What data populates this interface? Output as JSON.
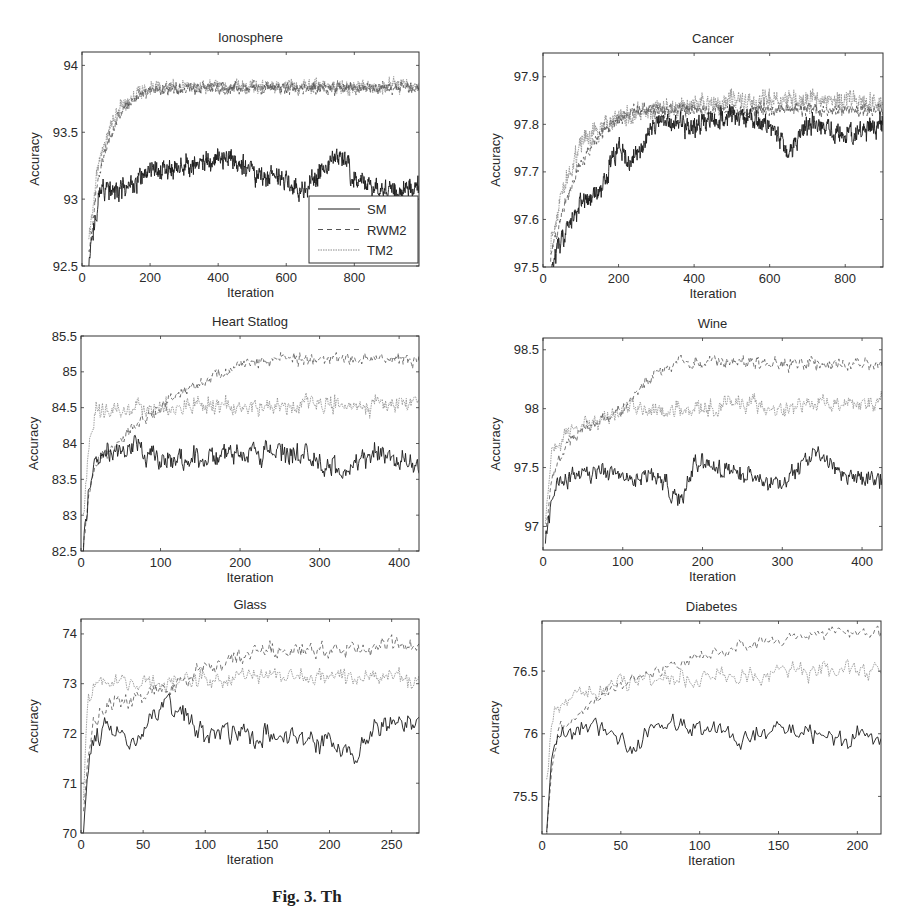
{
  "figure": {
    "caption_visible": "Fig. 3. Th",
    "legend": [
      {
        "name": "SM",
        "style": "solid",
        "color": "#1a1a1a"
      },
      {
        "name": "RWM2",
        "style": "dashed",
        "color": "#555555"
      },
      {
        "name": "TM2",
        "style": "dotted",
        "color": "#8a8a8a"
      }
    ]
  },
  "chart_data": [
    {
      "type": "line",
      "title": "Ionosphere",
      "xlabel": "Iteration",
      "ylabel": "Accuracy",
      "xlim": [
        0,
        990
      ],
      "ylim": [
        92.5,
        94.1
      ],
      "xticks": [
        0,
        200,
        400,
        600,
        800
      ],
      "yticks": [
        92.5,
        93,
        93.5,
        94
      ],
      "ytick_labels": [
        "92.5",
        "93",
        "93.5",
        "94"
      ],
      "legend_position": "lower right",
      "grid": false,
      "box": {
        "left": 82,
        "top": 52,
        "right": 419,
        "bottom": 266
      },
      "series": [
        {
          "name": "SM",
          "x": [
            20,
            40,
            60,
            100,
            150,
            200,
            300,
            400,
            450,
            500,
            600,
            650,
            700,
            760,
            800,
            900,
            990
          ],
          "values": [
            92.5,
            92.9,
            93.1,
            93.05,
            93.1,
            93.2,
            93.25,
            93.3,
            93.3,
            93.2,
            93.15,
            93.05,
            93.2,
            93.35,
            93.15,
            93.05,
            93.1
          ],
          "noise": 0.09
        },
        {
          "name": "RWM2",
          "x": [
            20,
            50,
            100,
            150,
            200,
            300,
            400,
            600,
            800,
            990
          ],
          "values": [
            92.6,
            93.2,
            93.6,
            93.75,
            93.82,
            93.83,
            93.83,
            93.83,
            93.83,
            93.83
          ],
          "noise": 0.05
        },
        {
          "name": "TM2",
          "x": [
            20,
            50,
            100,
            150,
            200,
            300,
            400,
            600,
            800,
            990
          ],
          "values": [
            92.7,
            93.3,
            93.65,
            93.78,
            93.83,
            93.84,
            93.84,
            93.84,
            93.84,
            93.85
          ],
          "noise": 0.06
        }
      ]
    },
    {
      "type": "line",
      "title": "Cancer",
      "xlabel": "Iteration",
      "ylabel": "Accuracy",
      "xlim": [
        0,
        900
      ],
      "ylim": [
        97.5,
        97.95
      ],
      "xticks": [
        0,
        200,
        400,
        600,
        800
      ],
      "yticks": [
        97.5,
        97.6,
        97.7,
        97.8,
        97.9
      ],
      "ytick_labels": [
        "97.5",
        "97.6",
        "97.7",
        "97.8",
        "97.9"
      ],
      "grid": false,
      "box": {
        "left": 543,
        "top": 53,
        "right": 883,
        "bottom": 267
      },
      "series": [
        {
          "name": "SM",
          "x": [
            20,
            50,
            100,
            150,
            200,
            230,
            300,
            400,
            500,
            600,
            650,
            700,
            800,
            900
          ],
          "values": [
            97.5,
            97.56,
            97.63,
            97.66,
            97.75,
            97.72,
            97.8,
            97.8,
            97.82,
            97.8,
            97.74,
            97.8,
            97.78,
            97.8
          ],
          "noise": 0.025
        },
        {
          "name": "RWM2",
          "x": [
            20,
            50,
            100,
            150,
            200,
            250,
            400,
            600,
            800,
            900
          ],
          "values": [
            97.52,
            97.62,
            97.72,
            97.78,
            97.81,
            97.83,
            97.83,
            97.83,
            97.83,
            97.83
          ],
          "noise": 0.015
        },
        {
          "name": "TM2",
          "x": [
            20,
            50,
            100,
            150,
            200,
            300,
            400,
            600,
            800,
            900
          ],
          "values": [
            97.55,
            97.66,
            97.76,
            97.79,
            97.81,
            97.83,
            97.84,
            97.85,
            97.85,
            97.84
          ],
          "noise": 0.025
        }
      ]
    },
    {
      "type": "line",
      "title": "Heart Statlog",
      "xlabel": "Iteration",
      "ylabel": "Accuracy",
      "xlim": [
        0,
        425
      ],
      "ylim": [
        82.5,
        85.5
      ],
      "xticks": [
        0,
        100,
        200,
        300,
        400
      ],
      "yticks": [
        82.5,
        83,
        83.5,
        84,
        84.5,
        85,
        85.5
      ],
      "ytick_labels": [
        "82.5",
        "83",
        "83.5",
        "84",
        "84.5",
        "85",
        "85.5"
      ],
      "grid": false,
      "box": {
        "left": 81,
        "top": 336,
        "right": 419,
        "bottom": 551
      },
      "series": [
        {
          "name": "SM",
          "x": [
            3,
            10,
            20,
            50,
            70,
            100,
            150,
            200,
            250,
            300,
            330,
            350,
            380,
            425
          ],
          "values": [
            82.5,
            83.4,
            83.85,
            83.9,
            84.0,
            83.75,
            83.8,
            83.9,
            83.9,
            83.8,
            83.6,
            83.8,
            83.85,
            83.7
          ],
          "noise": 0.18
        },
        {
          "name": "RWM2",
          "x": [
            3,
            10,
            20,
            50,
            100,
            150,
            200,
            250,
            300,
            350,
            425
          ],
          "values": [
            82.6,
            83.3,
            83.7,
            84.1,
            84.5,
            84.85,
            85.1,
            85.17,
            85.18,
            85.18,
            85.18
          ],
          "noise": 0.1
        },
        {
          "name": "TM2",
          "x": [
            3,
            10,
            20,
            50,
            100,
            150,
            200,
            250,
            300,
            350,
            425
          ],
          "values": [
            83.0,
            84.0,
            84.45,
            84.45,
            84.5,
            84.55,
            84.5,
            84.5,
            84.6,
            84.5,
            84.6
          ],
          "noise": 0.14
        }
      ]
    },
    {
      "type": "line",
      "title": "Wine",
      "xlabel": "Iteration",
      "ylabel": "Accuracy",
      "xlim": [
        0,
        425
      ],
      "ylim": [
        96.8,
        98.6
      ],
      "xticks": [
        0,
        100,
        200,
        300,
        400
      ],
      "yticks": [
        97,
        97.5,
        98,
        98.5
      ],
      "ytick_labels": [
        "97",
        "97.5",
        "98",
        "98.5"
      ],
      "grid": false,
      "box": {
        "left": 543,
        "top": 338,
        "right": 882,
        "bottom": 550
      },
      "series": [
        {
          "name": "SM",
          "x": [
            3,
            10,
            20,
            50,
            100,
            150,
            175,
            190,
            200,
            250,
            300,
            340,
            370,
            425
          ],
          "values": [
            96.85,
            97.2,
            97.35,
            97.45,
            97.45,
            97.4,
            97.2,
            97.6,
            97.55,
            97.45,
            97.35,
            97.65,
            97.45,
            97.4
          ],
          "noise": 0.09
        },
        {
          "name": "RWM2",
          "x": [
            3,
            10,
            30,
            60,
            100,
            130,
            160,
            200,
            250,
            300,
            425
          ],
          "values": [
            96.9,
            97.4,
            97.7,
            97.85,
            98.0,
            98.25,
            98.38,
            98.4,
            98.4,
            98.38,
            98.38
          ],
          "noise": 0.06
        },
        {
          "name": "TM2",
          "x": [
            3,
            10,
            30,
            60,
            100,
            150,
            200,
            250,
            300,
            350,
            425
          ],
          "values": [
            97.0,
            97.6,
            97.8,
            97.85,
            98.0,
            98.0,
            98.0,
            98.05,
            98.0,
            98.05,
            98.05
          ],
          "noise": 0.08
        }
      ]
    },
    {
      "type": "line",
      "title": "Glass",
      "xlabel": "Iteration",
      "ylabel": "Accuracy",
      "xlim": [
        0,
        272
      ],
      "ylim": [
        70,
        74.3
      ],
      "xticks": [
        0,
        50,
        100,
        150,
        200,
        250
      ],
      "yticks": [
        70,
        71,
        72,
        73,
        74
      ],
      "ytick_labels": [
        "70",
        "71",
        "72",
        "73",
        "74"
      ],
      "grid": false,
      "box": {
        "left": 81,
        "top": 619,
        "right": 419,
        "bottom": 833
      },
      "series": [
        {
          "name": "SM",
          "x": [
            2,
            5,
            10,
            20,
            40,
            70,
            100,
            150,
            200,
            220,
            230,
            250,
            272
          ],
          "values": [
            70.0,
            71.2,
            71.8,
            72.1,
            71.8,
            72.6,
            72.0,
            72.0,
            71.8,
            71.5,
            72.0,
            72.2,
            72.1
          ],
          "noise": 0.25
        },
        {
          "name": "RWM2",
          "x": [
            2,
            5,
            10,
            30,
            70,
            100,
            130,
            160,
            200,
            250,
            272
          ],
          "values": [
            70.5,
            71.5,
            72.3,
            72.6,
            72.9,
            73.3,
            73.55,
            73.65,
            73.7,
            73.75,
            73.75
          ],
          "noise": 0.2
        },
        {
          "name": "TM2",
          "x": [
            2,
            5,
            10,
            30,
            70,
            100,
            150,
            200,
            250,
            272
          ],
          "values": [
            70.8,
            72.5,
            73.1,
            73.0,
            73.0,
            73.1,
            73.15,
            73.1,
            73.2,
            73.1
          ],
          "noise": 0.22
        }
      ]
    },
    {
      "type": "line",
      "title": "Diabetes",
      "xlabel": "Iteration",
      "ylabel": "Accuracy",
      "xlim": [
        0,
        215
      ],
      "ylim": [
        75.2,
        76.9
      ],
      "xticks": [
        0,
        50,
        100,
        150,
        200
      ],
      "yticks": [
        75.5,
        76,
        76.5
      ],
      "ytick_labels": [
        "75.5",
        "76",
        "76.5"
      ],
      "grid": false,
      "box": {
        "left": 542,
        "top": 621,
        "right": 881,
        "bottom": 834
      },
      "series": [
        {
          "name": "SM",
          "x": [
            3,
            6,
            10,
            30,
            50,
            55,
            75,
            100,
            130,
            150,
            180,
            215
          ],
          "values": [
            75.2,
            75.85,
            76.0,
            76.1,
            75.95,
            75.85,
            76.1,
            76.05,
            75.95,
            76.05,
            75.95,
            76.0
          ],
          "noise": 0.09
        },
        {
          "name": "RWM2",
          "x": [
            3,
            6,
            10,
            30,
            50,
            75,
            100,
            125,
            150,
            180,
            215
          ],
          "values": [
            75.2,
            75.7,
            76.0,
            76.25,
            76.4,
            76.5,
            76.62,
            76.7,
            76.75,
            76.8,
            76.8
          ],
          "noise": 0.06
        },
        {
          "name": "TM2",
          "x": [
            3,
            6,
            10,
            30,
            50,
            75,
            100,
            130,
            150,
            180,
            215
          ],
          "values": [
            75.6,
            76.05,
            76.2,
            76.35,
            76.4,
            76.45,
            76.45,
            76.45,
            76.5,
            76.5,
            76.5
          ],
          "noise": 0.09
        }
      ]
    }
  ]
}
